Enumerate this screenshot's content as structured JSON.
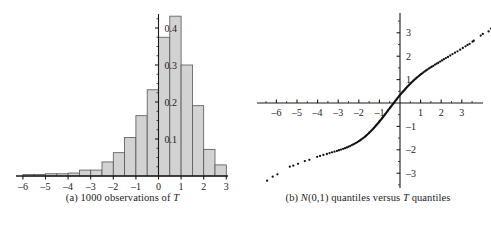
{
  "figure": {
    "panels": [
      {
        "id": "panel-a",
        "caption_prefix": "(a) 1000 observations of ",
        "caption_italic": "T",
        "caption_suffix": ""
      },
      {
        "id": "panel-b",
        "caption_prefix": "(b) ",
        "caption_italic": "N",
        "caption_mid": "(0,1) quantiles versus ",
        "caption_italic2": "T",
        "caption_suffix": " quantiles"
      }
    ]
  },
  "chart_data": [
    {
      "type": "bar",
      "title": "(a) 1000 observations of T",
      "subtitle": "",
      "xlabel": "",
      "ylabel": "",
      "bin_width": 0.5,
      "xlim": [
        -6.4,
        3.4
      ],
      "ylim": [
        0,
        0.46
      ],
      "xticks": [
        -6,
        -5,
        -4,
        -3,
        -2,
        -1,
        0,
        1,
        2,
        3
      ],
      "xtick_labels": [
        "–6",
        "–5",
        "–4",
        "–3",
        "–2",
        "–1",
        "0",
        "1",
        "2",
        "3"
      ],
      "yticks": [
        0.1,
        0.2,
        0.3,
        0.4
      ],
      "ytick_labels": [
        "0.1",
        "0.2",
        "0.3",
        "0.4"
      ],
      "yminor_step": 0.025,
      "grid": false,
      "legend": "none",
      "bar_fill": "#d2d2d2",
      "bar_stroke": "#555555",
      "axis_color": "#1a1a1a",
      "bin_left_edges": [
        -6.0,
        -5.5,
        -5.0,
        -4.5,
        -4.0,
        -3.5,
        -3.0,
        -2.5,
        -2.0,
        -1.5,
        -1.0,
        -0.5,
        0.0,
        0.5,
        1.0,
        1.5,
        2.0,
        2.5
      ],
      "categories": [
        "-6.0",
        "-5.5",
        "-5.0",
        "-4.5",
        "-4.0",
        "-3.5",
        "-3.0",
        "-2.5",
        "-2.0",
        "-1.5",
        "-1.0",
        "-0.5",
        "0.0",
        "0.5",
        "1.0",
        "1.5",
        "2.0",
        "2.5"
      ],
      "values": [
        0.004,
        0.004,
        0.006,
        0.006,
        0.008,
        0.016,
        0.016,
        0.038,
        0.063,
        0.104,
        0.163,
        0.233,
        0.375,
        0.432,
        0.3,
        0.19,
        0.072,
        0.03
      ]
    },
    {
      "type": "scatter",
      "title": "(b) N(0,1) quantiles versus T quantiles",
      "xlabel": "",
      "ylabel": "",
      "xlim": [
        -6.9,
        3.7
      ],
      "ylim": [
        -3.7,
        3.7
      ],
      "xticks": [
        -6,
        -5,
        -4,
        -3,
        -2,
        -1,
        1,
        2,
        3
      ],
      "xtick_labels": [
        "–6",
        "–5",
        "–4",
        "–3",
        "–2",
        "–1",
        "1",
        "2",
        "3"
      ],
      "yticks": [
        -3,
        -2,
        -1,
        1,
        2,
        3
      ],
      "ytick_labels": [
        "–3",
        "–2",
        "–1",
        "1",
        "2",
        "3"
      ],
      "xminor_step": 0.5,
      "yminor_step": 0.5,
      "grid": false,
      "legend": "none",
      "point_color": "#111111",
      "axis_color": "#1a1a1a",
      "description": "S-shaped heavy-tailed quantile-quantile curve: T quantiles on horizontal axis, N(0,1) quantiles on vertical axis",
      "points": [
        [
          -6.45,
          -3.32
        ],
        [
          -6.18,
          -3.15
        ],
        [
          -5.95,
          -3.05
        ],
        [
          -5.35,
          -2.72
        ],
        [
          -5.18,
          -2.68
        ],
        [
          -4.95,
          -2.6
        ],
        [
          -4.62,
          -2.48
        ],
        [
          -4.4,
          -2.43
        ],
        [
          -4.02,
          -2.3
        ],
        [
          -3.88,
          -2.26
        ],
        [
          -3.72,
          -2.22
        ],
        [
          -3.55,
          -2.18
        ],
        [
          -3.42,
          -2.14
        ],
        [
          -3.3,
          -2.11
        ],
        [
          -3.18,
          -2.08
        ],
        [
          -3.06,
          -2.05
        ],
        [
          -2.96,
          -2.02
        ],
        [
          -2.86,
          -1.99
        ],
        [
          -2.76,
          -1.96
        ],
        [
          -2.67,
          -1.93
        ],
        [
          -2.58,
          -1.9
        ],
        [
          -2.5,
          -1.87
        ],
        [
          -2.42,
          -1.84
        ],
        [
          -2.34,
          -1.8
        ],
        [
          -2.27,
          -1.77
        ],
        [
          -2.2,
          -1.74
        ],
        [
          -2.13,
          -1.7
        ],
        [
          -2.06,
          -1.67
        ],
        [
          -2.0,
          -1.63
        ],
        [
          -1.94,
          -1.6
        ],
        [
          -1.88,
          -1.56
        ],
        [
          -1.82,
          -1.52
        ],
        [
          -1.77,
          -1.49
        ],
        [
          -1.71,
          -1.45
        ],
        [
          -1.66,
          -1.41
        ],
        [
          -1.61,
          -1.37
        ],
        [
          -1.56,
          -1.33
        ],
        [
          -1.51,
          -1.29
        ],
        [
          -1.47,
          -1.25
        ],
        [
          -1.42,
          -1.21
        ],
        [
          -1.38,
          -1.17
        ],
        [
          -1.33,
          -1.13
        ],
        [
          -1.29,
          -1.09
        ],
        [
          -1.25,
          -1.05
        ],
        [
          -1.21,
          -1.01
        ],
        [
          -1.17,
          -0.97
        ],
        [
          -1.13,
          -0.93
        ],
        [
          -1.09,
          -0.89
        ],
        [
          -1.05,
          -0.85
        ],
        [
          -1.01,
          -0.81
        ],
        [
          -0.98,
          -0.77
        ],
        [
          -0.94,
          -0.73
        ],
        [
          -0.9,
          -0.69
        ],
        [
          -0.87,
          -0.65
        ],
        [
          -0.83,
          -0.61
        ],
        [
          -0.8,
          -0.57
        ],
        [
          -0.76,
          -0.53
        ],
        [
          -0.73,
          -0.49
        ],
        [
          -0.69,
          -0.45
        ],
        [
          -0.66,
          -0.41
        ],
        [
          -0.62,
          -0.37
        ],
        [
          -0.59,
          -0.33
        ],
        [
          -0.56,
          -0.29
        ],
        [
          -0.52,
          -0.25
        ],
        [
          -0.49,
          -0.21
        ],
        [
          -0.45,
          -0.17
        ],
        [
          -0.42,
          -0.13
        ],
        [
          -0.38,
          -0.09
        ],
        [
          -0.35,
          -0.05
        ],
        [
          -0.31,
          -0.01
        ],
        [
          -0.28,
          0.03
        ],
        [
          -0.24,
          0.07
        ],
        [
          -0.21,
          0.11
        ],
        [
          -0.17,
          0.15
        ],
        [
          -0.14,
          0.19
        ],
        [
          -0.1,
          0.23
        ],
        [
          -0.06,
          0.27
        ],
        [
          -0.03,
          0.31
        ],
        [
          0.01,
          0.35
        ],
        [
          0.05,
          0.39
        ],
        [
          0.09,
          0.43
        ],
        [
          0.13,
          0.47
        ],
        [
          0.17,
          0.51
        ],
        [
          0.21,
          0.55
        ],
        [
          0.25,
          0.59
        ],
        [
          0.29,
          0.63
        ],
        [
          0.33,
          0.67
        ],
        [
          0.37,
          0.71
        ],
        [
          0.42,
          0.75
        ],
        [
          0.46,
          0.79
        ],
        [
          0.51,
          0.83
        ],
        [
          0.55,
          0.87
        ],
        [
          0.6,
          0.91
        ],
        [
          0.65,
          0.95
        ],
        [
          0.7,
          0.99
        ],
        [
          0.75,
          1.03
        ],
        [
          0.8,
          1.07
        ],
        [
          0.85,
          1.11
        ],
        [
          0.91,
          1.15
        ],
        [
          0.96,
          1.19
        ],
        [
          1.02,
          1.23
        ],
        [
          1.08,
          1.27
        ],
        [
          1.14,
          1.31
        ],
        [
          1.2,
          1.35
        ],
        [
          1.27,
          1.39
        ],
        [
          1.33,
          1.43
        ],
        [
          1.4,
          1.47
        ],
        [
          1.47,
          1.51
        ],
        [
          1.54,
          1.55
        ],
        [
          1.62,
          1.59
        ],
        [
          1.7,
          1.64
        ],
        [
          1.78,
          1.68
        ],
        [
          1.86,
          1.72
        ],
        [
          1.95,
          1.77
        ],
        [
          2.04,
          1.82
        ],
        [
          2.13,
          1.87
        ],
        [
          2.23,
          1.92
        ],
        [
          2.33,
          1.97
        ],
        [
          2.44,
          2.03
        ],
        [
          2.55,
          2.09
        ],
        [
          2.67,
          2.15
        ],
        [
          2.79,
          2.21
        ],
        [
          2.92,
          2.28
        ],
        [
          3.05,
          2.35
        ],
        [
          3.18,
          2.42
        ],
        [
          3.28,
          2.48
        ],
        [
          3.38,
          2.53
        ],
        [
          3.52,
          2.62
        ],
        [
          3.58,
          2.66
        ],
        [
          3.92,
          2.88
        ],
        [
          4.02,
          2.95
        ],
        [
          4.3,
          3.06
        ],
        [
          4.42,
          3.18
        ]
      ]
    }
  ]
}
